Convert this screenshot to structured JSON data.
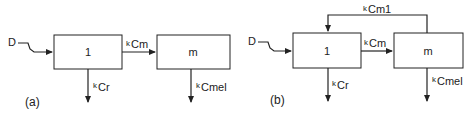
{
  "diagrams": [
    {
      "label": "(a)",
      "input": "D",
      "compartments": [
        "1",
        "m"
      ],
      "rates": {
        "transfer": "Cm",
        "elim_1": "Cr",
        "elim_m": "Cmel"
      }
    },
    {
      "label": "(b)",
      "input": "D",
      "compartments": [
        "1",
        "m"
      ],
      "rates": {
        "transfer": "Cm",
        "elim_1": "Cr",
        "elim_m": "Cmel",
        "return": "Cm1"
      }
    }
  ],
  "rate_prefix": "k"
}
